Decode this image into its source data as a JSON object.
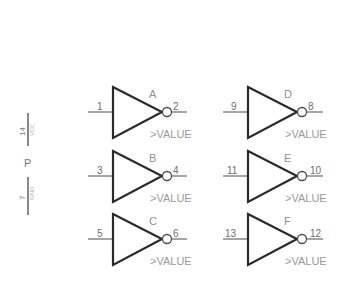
{
  "component": {
    "type": "hex-inverter",
    "value_placeholder": ">VALUE"
  },
  "power": {
    "name": "P",
    "pins": [
      {
        "number": "14",
        "net": "VCC"
      },
      {
        "number": "7",
        "net": "GND"
      }
    ]
  },
  "gates": [
    {
      "name": "A",
      "input_pin": "1",
      "output_pin": "2",
      "value": ">VALUE"
    },
    {
      "name": "B",
      "input_pin": "3",
      "output_pin": "4",
      "value": ">VALUE"
    },
    {
      "name": "C",
      "input_pin": "5",
      "output_pin": "6",
      "value": ">VALUE"
    },
    {
      "name": "D",
      "input_pin": "9",
      "output_pin": "8",
      "value": ">VALUE"
    },
    {
      "name": "E",
      "input_pin": "11",
      "output_pin": "10",
      "value": ">VALUE"
    },
    {
      "name": "F",
      "input_pin": "13",
      "output_pin": "12",
      "value": ">VALUE"
    }
  ],
  "colors": {
    "background": "#ffffff",
    "gate_outline": "#2a2a2a",
    "wire": "#6a6a6a",
    "label": "#9a9a9a"
  }
}
